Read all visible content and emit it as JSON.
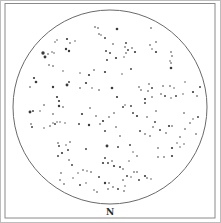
{
  "chart": {
    "type": "star-map",
    "direction_label": "N",
    "colors": {
      "ink": "#3a3a3a",
      "frame": "#8a8a8a",
      "background": "#ffffff"
    },
    "circle": {
      "cx": 110,
      "cy": 107,
      "r": 97
    },
    "stars": [
      {
        "x": 43,
        "y": 53,
        "s": 3
      },
      {
        "x": 45,
        "y": 57,
        "s": 2.5
      },
      {
        "x": 48,
        "y": 54,
        "s": 1.2
      },
      {
        "x": 52,
        "y": 52,
        "s": 1
      },
      {
        "x": 54,
        "y": 53,
        "s": 1
      },
      {
        "x": 55,
        "y": 42,
        "s": 1
      },
      {
        "x": 57,
        "y": 40,
        "s": 1
      },
      {
        "x": 67,
        "y": 39,
        "s": 1.8
      },
      {
        "x": 70,
        "y": 43,
        "s": 1.2
      },
      {
        "x": 75,
        "y": 41,
        "s": 1
      },
      {
        "x": 66,
        "y": 49,
        "s": 2
      },
      {
        "x": 69,
        "y": 51,
        "s": 2
      },
      {
        "x": 49,
        "y": 65,
        "s": 1.2
      },
      {
        "x": 53,
        "y": 66,
        "s": 1.2
      },
      {
        "x": 63,
        "y": 71,
        "s": 1
      },
      {
        "x": 34,
        "y": 78,
        "s": 1.8
      },
      {
        "x": 36,
        "y": 82,
        "s": 2.2
      },
      {
        "x": 30,
        "y": 87,
        "s": 1.2
      },
      {
        "x": 53,
        "y": 87,
        "s": 2
      },
      {
        "x": 67,
        "y": 85,
        "s": 2.5
      },
      {
        "x": 69,
        "y": 82,
        "s": 1.5
      },
      {
        "x": 57,
        "y": 97,
        "s": 1.8
      },
      {
        "x": 59,
        "y": 101,
        "s": 1.8
      },
      {
        "x": 59,
        "y": 106,
        "s": 2
      },
      {
        "x": 63,
        "y": 107,
        "s": 1.2
      },
      {
        "x": 44,
        "y": 105,
        "s": 1.2
      },
      {
        "x": 30,
        "y": 112,
        "s": 2.5
      },
      {
        "x": 33,
        "y": 111,
        "s": 1.5
      },
      {
        "x": 40,
        "y": 111,
        "s": 1
      },
      {
        "x": 53,
        "y": 114,
        "s": 1.2
      },
      {
        "x": 31,
        "y": 124,
        "s": 1.2
      },
      {
        "x": 32,
        "y": 127,
        "s": 1.5
      },
      {
        "x": 44,
        "y": 128,
        "s": 1
      },
      {
        "x": 50,
        "y": 126,
        "s": 1.2
      },
      {
        "x": 53,
        "y": 123,
        "s": 1
      },
      {
        "x": 55,
        "y": 124,
        "s": 1.5
      },
      {
        "x": 57,
        "y": 122,
        "s": 1
      },
      {
        "x": 60,
        "y": 122,
        "s": 1
      },
      {
        "x": 65,
        "y": 123,
        "s": 1
      },
      {
        "x": 95,
        "y": 27,
        "s": 1.2
      },
      {
        "x": 98,
        "y": 28,
        "s": 1.2
      },
      {
        "x": 99,
        "y": 34,
        "s": 1.2
      },
      {
        "x": 101,
        "y": 35,
        "s": 1
      },
      {
        "x": 105,
        "y": 38,
        "s": 1.5
      },
      {
        "x": 117,
        "y": 29,
        "s": 2.2
      },
      {
        "x": 113,
        "y": 44,
        "s": 1.2
      },
      {
        "x": 106,
        "y": 51,
        "s": 1.5
      },
      {
        "x": 110,
        "y": 53,
        "s": 1.5
      },
      {
        "x": 125,
        "y": 47,
        "s": 1.2
      },
      {
        "x": 128,
        "y": 50,
        "s": 1.5
      },
      {
        "x": 132,
        "y": 48,
        "s": 1.2
      },
      {
        "x": 126,
        "y": 53,
        "s": 1.2
      },
      {
        "x": 135,
        "y": 52,
        "s": 1.8
      },
      {
        "x": 107,
        "y": 60,
        "s": 1.5
      },
      {
        "x": 126,
        "y": 43,
        "s": 1.5
      },
      {
        "x": 116,
        "y": 58,
        "s": 1.8
      },
      {
        "x": 124,
        "y": 57,
        "s": 1
      },
      {
        "x": 131,
        "y": 69,
        "s": 1.5
      },
      {
        "x": 122,
        "y": 74,
        "s": 1
      },
      {
        "x": 80,
        "y": 73,
        "s": 1
      },
      {
        "x": 89,
        "y": 75,
        "s": 1.8
      },
      {
        "x": 94,
        "y": 70,
        "s": 1.2
      },
      {
        "x": 105,
        "y": 72,
        "s": 1.8
      },
      {
        "x": 151,
        "y": 28,
        "s": 1.2
      },
      {
        "x": 156,
        "y": 42,
        "s": 1.2
      },
      {
        "x": 150,
        "y": 45,
        "s": 1.2
      },
      {
        "x": 152,
        "y": 49,
        "s": 1
      },
      {
        "x": 156,
        "y": 52,
        "s": 1.8
      },
      {
        "x": 171,
        "y": 52,
        "s": 1.2
      },
      {
        "x": 172,
        "y": 56,
        "s": 1.2
      },
      {
        "x": 170,
        "y": 61,
        "s": 1
      },
      {
        "x": 171,
        "y": 63,
        "s": 1.2
      },
      {
        "x": 171,
        "y": 68,
        "s": 2.2
      },
      {
        "x": 139,
        "y": 87,
        "s": 1.2
      },
      {
        "x": 149,
        "y": 84,
        "s": 1.2
      },
      {
        "x": 148,
        "y": 91,
        "s": 1.2
      },
      {
        "x": 141,
        "y": 90,
        "s": 1.2
      },
      {
        "x": 152,
        "y": 88,
        "s": 1.5
      },
      {
        "x": 145,
        "y": 99,
        "s": 1.8
      },
      {
        "x": 145,
        "y": 103,
        "s": 1.5
      },
      {
        "x": 152,
        "y": 97,
        "s": 1.2
      },
      {
        "x": 161,
        "y": 94,
        "s": 1.2
      },
      {
        "x": 165,
        "y": 96,
        "s": 1.5
      },
      {
        "x": 176,
        "y": 96,
        "s": 1.5
      },
      {
        "x": 171,
        "y": 98,
        "s": 1
      },
      {
        "x": 183,
        "y": 94,
        "s": 1
      },
      {
        "x": 197,
        "y": 96,
        "s": 1.2
      },
      {
        "x": 185,
        "y": 82,
        "s": 1
      },
      {
        "x": 163,
        "y": 86,
        "s": 1.2
      },
      {
        "x": 170,
        "y": 86,
        "s": 1.2
      },
      {
        "x": 174,
        "y": 88,
        "s": 1
      },
      {
        "x": 200,
        "y": 87,
        "s": 1.5
      },
      {
        "x": 193,
        "y": 92,
        "s": 1.8
      },
      {
        "x": 86,
        "y": 83,
        "s": 1.8
      },
      {
        "x": 80,
        "y": 88,
        "s": 1.2
      },
      {
        "x": 92,
        "y": 88,
        "s": 1
      },
      {
        "x": 99,
        "y": 90,
        "s": 1.2
      },
      {
        "x": 112,
        "y": 88,
        "s": 2.2
      },
      {
        "x": 117,
        "y": 97,
        "s": 1.8
      },
      {
        "x": 114,
        "y": 113,
        "s": 1.2
      },
      {
        "x": 123,
        "y": 107,
        "s": 1.5
      },
      {
        "x": 125,
        "y": 105,
        "s": 1
      },
      {
        "x": 131,
        "y": 106,
        "s": 1.5
      },
      {
        "x": 133,
        "y": 113,
        "s": 1.5
      },
      {
        "x": 137,
        "y": 116,
        "s": 1.8
      },
      {
        "x": 116,
        "y": 127,
        "s": 1.2
      },
      {
        "x": 120,
        "y": 136,
        "s": 1.2
      },
      {
        "x": 90,
        "y": 108,
        "s": 1.2
      },
      {
        "x": 82,
        "y": 114,
        "s": 1.8
      },
      {
        "x": 79,
        "y": 124,
        "s": 1.5
      },
      {
        "x": 96,
        "y": 116,
        "s": 1.2
      },
      {
        "x": 89,
        "y": 125,
        "s": 2
      },
      {
        "x": 100,
        "y": 124,
        "s": 1.2
      },
      {
        "x": 103,
        "y": 121,
        "s": 1.8
      },
      {
        "x": 109,
        "y": 117,
        "s": 1.2
      },
      {
        "x": 105,
        "y": 131,
        "s": 1.5
      },
      {
        "x": 147,
        "y": 117,
        "s": 1.2
      },
      {
        "x": 156,
        "y": 111,
        "s": 1.2
      },
      {
        "x": 155,
        "y": 122,
        "s": 1.5
      },
      {
        "x": 153,
        "y": 127,
        "s": 1.2
      },
      {
        "x": 160,
        "y": 130,
        "s": 1.5
      },
      {
        "x": 169,
        "y": 126,
        "s": 1.8
      },
      {
        "x": 166,
        "y": 133,
        "s": 1.2
      },
      {
        "x": 172,
        "y": 126,
        "s": 1.2
      },
      {
        "x": 190,
        "y": 123,
        "s": 1.2
      },
      {
        "x": 193,
        "y": 119,
        "s": 1
      },
      {
        "x": 184,
        "y": 113,
        "s": 1.2
      },
      {
        "x": 198,
        "y": 117,
        "s": 1.5
      },
      {
        "x": 185,
        "y": 129,
        "s": 1.2
      },
      {
        "x": 180,
        "y": 137,
        "s": 1.2
      },
      {
        "x": 196,
        "y": 134,
        "s": 1.2
      },
      {
        "x": 140,
        "y": 131,
        "s": 1.5
      },
      {
        "x": 145,
        "y": 134,
        "s": 1.2
      },
      {
        "x": 150,
        "y": 136,
        "s": 1.2
      },
      {
        "x": 58,
        "y": 143,
        "s": 1.2
      },
      {
        "x": 59,
        "y": 146,
        "s": 1.5
      },
      {
        "x": 62,
        "y": 153,
        "s": 1.8
      },
      {
        "x": 58,
        "y": 156,
        "s": 1.5
      },
      {
        "x": 66,
        "y": 145,
        "s": 1
      },
      {
        "x": 68,
        "y": 150,
        "s": 1.5
      },
      {
        "x": 69,
        "y": 160,
        "s": 1.2
      },
      {
        "x": 72,
        "y": 165,
        "s": 1.5
      },
      {
        "x": 70,
        "y": 142,
        "s": 1.2
      },
      {
        "x": 61,
        "y": 173,
        "s": 1.2
      },
      {
        "x": 60,
        "y": 180,
        "s": 1.2
      },
      {
        "x": 64,
        "y": 184,
        "s": 1.2
      },
      {
        "x": 73,
        "y": 178,
        "s": 1
      },
      {
        "x": 80,
        "y": 185,
        "s": 1.5
      },
      {
        "x": 78,
        "y": 173,
        "s": 1
      },
      {
        "x": 83,
        "y": 170,
        "s": 1.2
      },
      {
        "x": 87,
        "y": 171,
        "s": 1
      },
      {
        "x": 107,
        "y": 146,
        "s": 2.5
      },
      {
        "x": 86,
        "y": 149,
        "s": 1.5
      },
      {
        "x": 105,
        "y": 158,
        "s": 1.5
      },
      {
        "x": 103,
        "y": 163,
        "s": 1.8
      },
      {
        "x": 108,
        "y": 163,
        "s": 1.5
      },
      {
        "x": 112,
        "y": 161,
        "s": 1.2
      },
      {
        "x": 114,
        "y": 166,
        "s": 1.8
      },
      {
        "x": 120,
        "y": 167,
        "s": 1.5
      },
      {
        "x": 123,
        "y": 169,
        "s": 1.2
      },
      {
        "x": 129,
        "y": 161,
        "s": 1
      },
      {
        "x": 118,
        "y": 147,
        "s": 1.5
      },
      {
        "x": 130,
        "y": 145,
        "s": 1.5
      },
      {
        "x": 133,
        "y": 152,
        "s": 1
      },
      {
        "x": 137,
        "y": 156,
        "s": 1.2
      },
      {
        "x": 91,
        "y": 172,
        "s": 1.2
      },
      {
        "x": 99,
        "y": 177,
        "s": 1.5
      },
      {
        "x": 105,
        "y": 183,
        "s": 2
      },
      {
        "x": 109,
        "y": 183,
        "s": 1.2
      },
      {
        "x": 108,
        "y": 189,
        "s": 1.2
      },
      {
        "x": 113,
        "y": 187,
        "s": 1.2
      },
      {
        "x": 118,
        "y": 189,
        "s": 1.5
      },
      {
        "x": 124,
        "y": 191,
        "s": 1.2
      },
      {
        "x": 125,
        "y": 186,
        "s": 1
      },
      {
        "x": 123,
        "y": 180,
        "s": 1.2
      },
      {
        "x": 127,
        "y": 176,
        "s": 1.5
      },
      {
        "x": 134,
        "y": 172,
        "s": 1.2
      },
      {
        "x": 139,
        "y": 180,
        "s": 1.5
      },
      {
        "x": 137,
        "y": 172,
        "s": 1.2
      },
      {
        "x": 131,
        "y": 177,
        "s": 1
      },
      {
        "x": 86,
        "y": 183,
        "s": 1
      },
      {
        "x": 94,
        "y": 190,
        "s": 1
      },
      {
        "x": 97,
        "y": 192,
        "s": 1.2
      },
      {
        "x": 158,
        "y": 148,
        "s": 1.2
      },
      {
        "x": 158,
        "y": 157,
        "s": 1.2
      },
      {
        "x": 172,
        "y": 148,
        "s": 1.8
      },
      {
        "x": 172,
        "y": 156,
        "s": 1.8
      },
      {
        "x": 164,
        "y": 157,
        "s": 1.2
      },
      {
        "x": 180,
        "y": 147,
        "s": 1
      },
      {
        "x": 184,
        "y": 144,
        "s": 1
      },
      {
        "x": 145,
        "y": 176,
        "s": 1.8
      },
      {
        "x": 147,
        "y": 178,
        "s": 1.2
      },
      {
        "x": 151,
        "y": 179,
        "s": 1
      },
      {
        "x": 177,
        "y": 143,
        "s": 1
      }
    ]
  }
}
